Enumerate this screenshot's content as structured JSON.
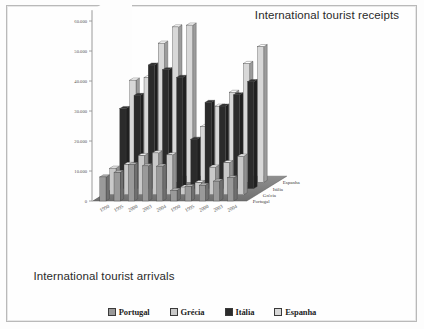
{
  "titles": {
    "receipts": "International tourist receipts",
    "arrivals": "International tourist arrivals"
  },
  "legend": {
    "items": [
      {
        "label": "Portugal",
        "color": "#9a9a9a"
      },
      {
        "label": "Grécia",
        "color": "#c9c9c9"
      },
      {
        "label": "Itália",
        "color": "#2b2b2b"
      },
      {
        "label": "Espanha",
        "color": "#d8d8d8"
      }
    ]
  },
  "axis": {
    "y_ticks": [
      "60.000",
      "50.000",
      "40.000",
      "30.000",
      "20.000",
      "10.000",
      "0"
    ],
    "x_front_years": [
      "1990",
      "1995",
      "2000",
      "2003",
      "2004"
    ],
    "x_back_years": [
      "1990",
      "1995",
      "2000",
      "2003",
      "2004"
    ],
    "depth_labels": [
      "Espanha",
      "Itália",
      "Grécia",
      "Portugal"
    ]
  },
  "chart_data": {
    "type": "bar",
    "subtitle": "",
    "xlabel": "",
    "ylabel": "",
    "ylim": [
      0,
      60000
    ],
    "yticks": [
      0,
      10000,
      20000,
      30000,
      40000,
      50000,
      60000
    ],
    "grid": false,
    "legend_position": "bottom",
    "note": "3-D column chart: two panels (left = arrivals, right = receipts), depth axis = country, category axis = year.",
    "categories": [
      "1990",
      "1995",
      "2000",
      "2003",
      "2004"
    ],
    "panels": [
      {
        "name": "International tourist arrivals",
        "series": [
          {
            "name": "Portugal",
            "values": [
              8020,
              9511,
              12097,
              11707,
              11617
            ]
          },
          {
            "name": "Grécia",
            "values": [
              8873,
              10130,
              13096,
              13969,
              13313
            ]
          },
          {
            "name": "Itália",
            "values": [
              26679,
              31052,
              41181,
              39604,
              37071
            ]
          },
          {
            "name": "Espanha",
            "values": [
              34085,
              34920,
              46403,
              51830,
              52430
            ]
          }
        ]
      },
      {
        "name": "International tourist receipts",
        "series": [
          {
            "name": "Portugal",
            "values": [
              3555,
              4841,
              5243,
              6628,
              7731
            ]
          },
          {
            "name": "Grécia",
            "values": [
              2587,
              4080,
              9221,
              10741,
              12872
            ]
          },
          {
            "name": "Itália",
            "values": [
              16458,
              28731,
              27493,
              31247,
              35656
            ]
          },
          {
            "name": "Espanha",
            "values": [
              18593,
              25386,
              30013,
              39645,
              45248
            ]
          }
        ]
      }
    ]
  }
}
